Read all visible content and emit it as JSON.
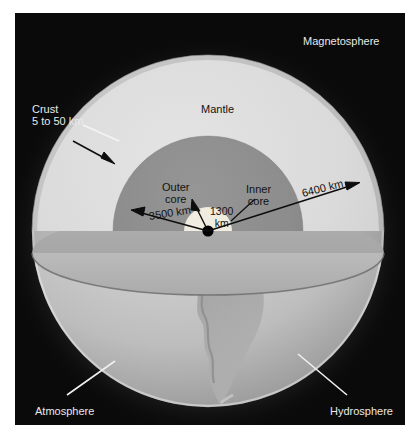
{
  "figure": {
    "background_color": "#0a0a0a",
    "page_background": "#ffffff"
  },
  "labels": {
    "magnetosphere": "Magnetosphere",
    "crust_name": "Crust",
    "crust_thickness": "5 to 50 km",
    "mantle": "Mantle",
    "outer_core_line1": "Outer",
    "outer_core_line2": "core",
    "inner_core_line1": "Inner",
    "inner_core_line2": "core",
    "inner_core_radius_line1": "1300",
    "inner_core_radius_line2": "km",
    "outer_core_radius": "3500 km",
    "earth_radius": "6400 km",
    "atmosphere": "Atmosphere",
    "hydrosphere": "Hydrosphere"
  },
  "measurements": {
    "crust_thickness_km": "5 to 50 km",
    "inner_core_radius_km": "1300 km",
    "outer_core_radius_km": "3500 km",
    "earth_radius_km": "6400 km"
  },
  "layers": [
    {
      "name": "crust",
      "label": "Crust",
      "color": "#cfcfcf"
    },
    {
      "name": "mantle",
      "label": "Mantle",
      "color": "#d9d9d9"
    },
    {
      "name": "outer-core",
      "label": "Outer core",
      "color": "#8d8d8d"
    },
    {
      "name": "inner-core",
      "label": "Inner core",
      "color": "#f1ece0"
    },
    {
      "name": "center-dot",
      "label": "",
      "color": "#000000"
    }
  ],
  "spheres": [
    {
      "name": "magnetosphere",
      "label": "Magnetosphere",
      "color": "#141414"
    },
    {
      "name": "atmosphere",
      "label": "Atmosphere",
      "color": "#b9b9b9"
    },
    {
      "name": "hydrosphere",
      "label": "Hydrosphere",
      "color": "#c6c6c6"
    }
  ],
  "colors": {
    "panel": "#0a0a0a",
    "mantle": "#d9d9d9",
    "outer_core": "#8d8d8d",
    "inner_core": "#f1ece0",
    "lower_sphere": "#c9c9c9",
    "cut_plane": "#b5b5b5",
    "rim_line": "#6f6f6f",
    "leader_light": "#f2f2f2",
    "leader_dark": "#0d0d0d"
  }
}
